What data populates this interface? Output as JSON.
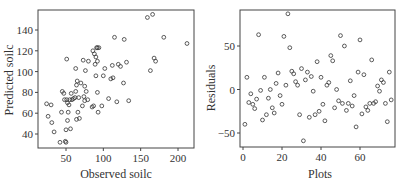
{
  "chart_data": [
    {
      "type": "scatter",
      "title": "",
      "xlabel": "Observed soilc",
      "ylabel": "Predicted soilc",
      "xlim": [
        20,
        220
      ],
      "ylim": [
        28,
        158
      ],
      "xticks": [
        50,
        100,
        150,
        200
      ],
      "yticks": [
        40,
        60,
        80,
        100,
        120,
        140
      ],
      "grid": false,
      "legend": null,
      "marker": "open-circle",
      "points": [
        [
          24,
          69
        ],
        [
          26,
          57
        ],
        [
          30,
          68
        ],
        [
          31,
          51
        ],
        [
          34,
          42
        ],
        [
          42,
          32
        ],
        [
          44,
          61
        ],
        [
          45,
          81
        ],
        [
          47,
          79
        ],
        [
          48,
          73
        ],
        [
          49,
          33
        ],
        [
          50,
          44
        ],
        [
          50,
          32
        ],
        [
          51,
          112
        ],
        [
          51,
          73
        ],
        [
          52,
          53
        ],
        [
          52,
          70
        ],
        [
          53,
          61
        ],
        [
          54,
          68
        ],
        [
          55,
          73
        ],
        [
          56,
          45
        ],
        [
          57,
          79
        ],
        [
          58,
          73
        ],
        [
          60,
          74
        ],
        [
          62,
          75
        ],
        [
          63,
          103
        ],
        [
          63,
          81
        ],
        [
          64,
          87
        ],
        [
          64,
          54
        ],
        [
          65,
          91
        ],
        [
          66,
          61
        ],
        [
          67,
          75
        ],
        [
          68,
          55
        ],
        [
          70,
          89
        ],
        [
          72,
          67
        ],
        [
          73,
          111
        ],
        [
          74,
          76
        ],
        [
          75,
          72
        ],
        [
          75,
          86
        ],
        [
          76,
          101
        ],
        [
          77,
          81
        ],
        [
          79,
          73
        ],
        [
          80,
          110
        ],
        [
          85,
          66
        ],
        [
          86,
          120
        ],
        [
          87,
          67
        ],
        [
          88,
          117
        ],
        [
          89,
          107
        ],
        [
          90,
          96
        ],
        [
          90,
          114
        ],
        [
          91,
          123
        ],
        [
          92,
          110
        ],
        [
          92,
          80
        ],
        [
          92,
          123
        ],
        [
          93,
          61
        ],
        [
          94,
          123
        ],
        [
          98,
          67
        ],
        [
          100,
          96
        ],
        [
          102,
          103
        ],
        [
          107,
          74
        ],
        [
          110,
          93
        ],
        [
          112,
          106
        ],
        [
          113,
          94
        ],
        [
          115,
          133
        ],
        [
          118,
          71
        ],
        [
          120,
          107
        ],
        [
          123,
          105
        ],
        [
          127,
          89
        ],
        [
          128,
          131
        ],
        [
          131,
          109
        ],
        [
          134,
          72
        ],
        [
          159,
          152
        ],
        [
          163,
          101
        ],
        [
          166,
          155
        ],
        [
          168,
          113
        ],
        [
          170,
          110
        ],
        [
          181,
          133
        ],
        [
          212,
          127
        ]
      ]
    },
    {
      "type": "scatter",
      "title": "",
      "xlabel": "Plots",
      "ylabel": "Residuals",
      "xlim": [
        -1,
        78
      ],
      "ylim": [
        -65,
        97
      ],
      "xticks": [
        0,
        20,
        40,
        60
      ],
      "yticks": [
        -50,
        0,
        50
      ],
      "grid": false,
      "legend": null,
      "marker": "open-circle",
      "points": [
        [
          1,
          -40
        ],
        [
          2,
          14
        ],
        [
          3,
          -15
        ],
        [
          4,
          -5
        ],
        [
          5,
          -17
        ],
        [
          6,
          -22
        ],
        [
          7,
          -11
        ],
        [
          8,
          63
        ],
        [
          9,
          -1
        ],
        [
          10,
          -35
        ],
        [
          11,
          14
        ],
        [
          12,
          -29
        ],
        [
          13,
          -10
        ],
        [
          14,
          0
        ],
        [
          15,
          -21
        ],
        [
          16,
          -27
        ],
        [
          17,
          7
        ],
        [
          18,
          19
        ],
        [
          19,
          -7
        ],
        [
          20,
          -17
        ],
        [
          21,
          61
        ],
        [
          22,
          5
        ],
        [
          23,
          87
        ],
        [
          24,
          48
        ],
        [
          25,
          21
        ],
        [
          26,
          18
        ],
        [
          27,
          9
        ],
        [
          28,
          5
        ],
        [
          29,
          -29
        ],
        [
          30,
          24
        ],
        [
          31,
          -59
        ],
        [
          32,
          11
        ],
        [
          33,
          20
        ],
        [
          34,
          -32
        ],
        [
          35,
          15
        ],
        [
          36,
          -2
        ],
        [
          37,
          -29
        ],
        [
          38,
          32
        ],
        [
          39,
          -25
        ],
        [
          40,
          14
        ],
        [
          41,
          -17
        ],
        [
          42,
          -36
        ],
        [
          43,
          5
        ],
        [
          44,
          8
        ],
        [
          45,
          39
        ],
        [
          46,
          33
        ],
        [
          47,
          -21
        ],
        [
          48,
          0
        ],
        [
          49,
          -13
        ],
        [
          50,
          62
        ],
        [
          51,
          -16
        ],
        [
          52,
          50
        ],
        [
          53,
          -24
        ],
        [
          54,
          -16
        ],
        [
          55,
          10
        ],
        [
          56,
          -19
        ],
        [
          57,
          -7
        ],
        [
          58,
          -43
        ],
        [
          59,
          20
        ],
        [
          60,
          57
        ],
        [
          61,
          -28
        ],
        [
          62,
          17
        ],
        [
          63,
          -20
        ],
        [
          64,
          -24
        ],
        [
          65,
          -16
        ],
        [
          66,
          34
        ],
        [
          67,
          -16
        ],
        [
          68,
          -14
        ],
        [
          69,
          4
        ],
        [
          70,
          -2
        ],
        [
          71,
          11
        ],
        [
          72,
          8
        ],
        [
          73,
          -16
        ],
        [
          74,
          -37
        ],
        [
          75,
          20
        ],
        [
          76,
          -12
        ]
      ]
    }
  ],
  "charts": {
    "left": {
      "xlabel": "Observed soilc",
      "ylabel": "Predicted soilc",
      "xtick_labels": [
        "50",
        "100",
        "150",
        "200"
      ],
      "ytick_labels": [
        "40",
        "60",
        "80",
        "100",
        "120",
        "140"
      ]
    },
    "right": {
      "xlabel": "Plots",
      "ylabel": "Residuals",
      "xtick_labels": [
        "0",
        "20",
        "40",
        "60"
      ],
      "ytick_labels": [
        "-50",
        "0",
        "50"
      ]
    }
  }
}
